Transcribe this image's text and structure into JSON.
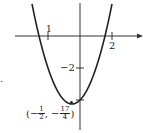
{
  "chart_data": {
    "type": "line",
    "title": "",
    "function": "y = x^2 + x - 4",
    "xlabel": "",
    "ylabel": "",
    "x_ticks": [
      {
        "value": -2,
        "label": "1"
      },
      {
        "value": 2,
        "label": "2"
      }
    ],
    "y_ticks": [
      {
        "value": -2,
        "label": "-2"
      },
      {
        "value": -4.25,
        "label": ""
      }
    ],
    "vertex": {
      "x": -0.5,
      "y": -4.25,
      "label_x_num": "1",
      "label_x_den": "2",
      "label_y_num": "17",
      "label_y_den": "4"
    },
    "x_intercepts": [
      -2.56,
      1.56
    ],
    "xlim": [
      -5,
      3.9
    ],
    "ylim": [
      -6,
      2.25
    ],
    "grid": false
  },
  "labels": {
    "xtick_left": "1",
    "xtick_right": "2",
    "ytick": "−2",
    "vertex_open": "(−",
    "vertex_comma": ", −",
    "vertex_close": ")",
    "vx_num": "1",
    "vx_den": "2",
    "vy_num": "17",
    "vy_den": "4",
    "side_mark": "."
  }
}
